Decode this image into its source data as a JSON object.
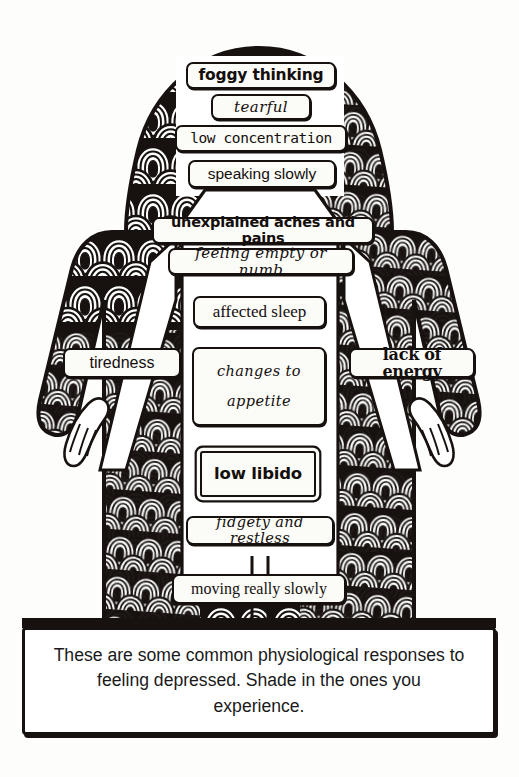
{
  "page": {
    "title": "Physiological responses to feeling depressed",
    "background_color": "#fdfdfc",
    "ink_color": "#16110f",
    "label_fill_color": "#fbfbf8"
  },
  "figure": {
    "pattern_name": "concentric-arch-doodle",
    "arms_pose": "arms hanging down and slightly out from the body with hands visible at the hips"
  },
  "labels": [
    {
      "id": "foggy-thinking",
      "text": "foggy thinking",
      "style": "f-bold",
      "font_size": 15.5,
      "x": 186,
      "y": 62,
      "w": 150,
      "h": 27
    },
    {
      "id": "tearful",
      "text": "tearful",
      "style": "f-script",
      "font_size": 15,
      "x": 211,
      "y": 94,
      "w": 100,
      "h": 26
    },
    {
      "id": "low-concentration",
      "text": "low concentration",
      "style": "f-mono",
      "font_size": 14.5,
      "x": 175,
      "y": 125,
      "w": 172,
      "h": 27
    },
    {
      "id": "speaking-slowly",
      "text": "speaking slowly",
      "style": "f-sans",
      "font_size": 15.5,
      "x": 188,
      "y": 160,
      "w": 148,
      "h": 28
    },
    {
      "id": "unexplained-aches-and-pains",
      "text": "unexplained aches and pains",
      "style": "f-bold",
      "font_size": 14.5,
      "x": 152,
      "y": 217,
      "w": 222,
      "h": 27
    },
    {
      "id": "feeling-empty-or-numb",
      "text": "feeling empty or numb",
      "style": "f-script",
      "font_size": 15,
      "x": 168,
      "y": 248,
      "w": 186,
      "h": 27
    },
    {
      "id": "affected-sleep",
      "text": "affected sleep",
      "style": "f-serif",
      "font_size": 17,
      "x": 193,
      "y": 296,
      "w": 133,
      "h": 32
    },
    {
      "id": "tiredness",
      "text": "tiredness",
      "style": "f-sans",
      "font_size": 16,
      "x": 63,
      "y": 348,
      "w": 118,
      "h": 30
    },
    {
      "id": "lack-of-energy",
      "text": "lack of energy",
      "style": "f-heavy",
      "font_size": 16,
      "x": 349,
      "y": 348,
      "w": 126,
      "h": 30
    },
    {
      "id": "changes-to-appetite",
      "text": "changes to\nappetite",
      "style": "f-script",
      "font_size": 14.5,
      "x": 192,
      "y": 347,
      "w": 134,
      "h": 79
    },
    {
      "id": "low-libido",
      "text": "low libido",
      "style": "f-bold",
      "font_size": 16.5,
      "x": 200,
      "y": 451,
      "w": 116,
      "h": 46
    },
    {
      "id": "fidgety-and-restless",
      "text": "fidgety and restless",
      "style": "f-script",
      "font_size": 14.5,
      "x": 186,
      "y": 516,
      "w": 148,
      "h": 29
    },
    {
      "id": "moving-really-slowly",
      "text": "moving really slowly",
      "style": "f-serif",
      "font_size": 16,
      "x": 172,
      "y": 574,
      "w": 174,
      "h": 30
    }
  ],
  "caption": {
    "text": "These are some common physiological responses to feeling depressed. Shade in the ones you experience.",
    "x": 22,
    "y": 627,
    "w": 474,
    "h": 108
  }
}
